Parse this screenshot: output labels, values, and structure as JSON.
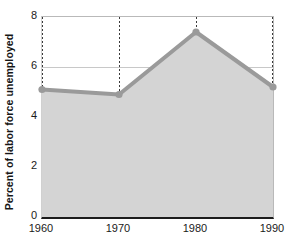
{
  "chart_data": {
    "type": "area",
    "title": "",
    "xlabel": "",
    "ylabel": "Percent of labor force unemployed",
    "x": [
      1960,
      1970,
      1980,
      1990
    ],
    "categories": [
      "1960",
      "1970",
      "1980",
      "1990"
    ],
    "values": [
      5.1,
      4.9,
      7.4,
      5.2
    ],
    "series": [
      {
        "name": "Percent of labor force unemployed",
        "values": [
          5.1,
          4.9,
          7.4,
          5.2
        ]
      }
    ],
    "xlim": [
      1960,
      1990
    ],
    "ylim": [
      0,
      8
    ],
    "ytick_labels": [
      "0",
      "2",
      "4",
      "6",
      "8"
    ],
    "ytick_values": [
      0,
      2,
      4,
      6,
      8
    ],
    "xtick_labels": [
      "1960",
      "1970",
      "1980",
      "1990"
    ],
    "xtick_values": [
      1960,
      1970,
      1980,
      1990
    ],
    "grid": "horizontal-solid-and-vertical-dotted",
    "legend": "none",
    "colors": {
      "line": "#9a9a9a",
      "fill": "#d4d4d4",
      "marker": "#9a9a9a",
      "gridline": "#9a9a9a",
      "axis": "#1c1c1c",
      "text": "#1a1a1a",
      "background": "#ffffff"
    }
  },
  "axes": {
    "y_title": "Percent of labor force unemployed",
    "y_ticks": [
      {
        "label": "8",
        "value": 8
      },
      {
        "label": "6",
        "value": 6
      },
      {
        "label": "4",
        "value": 4
      },
      {
        "label": "2",
        "value": 2
      },
      {
        "label": "0",
        "value": 0
      }
    ],
    "x_ticks": [
      {
        "label": "1960",
        "value": 1960
      },
      {
        "label": "1970",
        "value": 1970
      },
      {
        "label": "1980",
        "value": 1980
      },
      {
        "label": "1990",
        "value": 1990
      }
    ]
  }
}
